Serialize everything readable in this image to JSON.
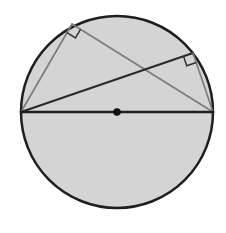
{
  "diagram": {
    "colors": {
      "background": "#ffffff",
      "circle_fill": "#d4d4d4",
      "circle_stroke": "#1e1e1e",
      "diameter_stroke": "#1e1e1e",
      "chord_dark": "#2a2a2a",
      "chord_light": "#7a7a7a",
      "right_angle_marker": "#333333",
      "center_dot": "#111111"
    },
    "circle": {
      "cx": 117,
      "cy": 112,
      "r": 96
    },
    "points": {
      "A": {
        "x": 21,
        "y": 112
      },
      "B": {
        "x": 213,
        "y": 112
      },
      "C": {
        "x": 72,
        "y": 24
      },
      "D": {
        "x": 193,
        "y": 53
      },
      "O": {
        "x": 117,
        "y": 112
      }
    },
    "segments": [
      {
        "name": "diameter",
        "from": "A",
        "to": "B"
      },
      {
        "name": "chord-AC",
        "from": "A",
        "to": "C"
      },
      {
        "name": "chord-CB",
        "from": "C",
        "to": "B"
      },
      {
        "name": "chord-AD",
        "from": "A",
        "to": "D"
      },
      {
        "name": "chord-DB",
        "from": "D",
        "to": "B"
      }
    ],
    "right_angles": [
      {
        "at": "C",
        "label": "right angle at C"
      },
      {
        "at": "D",
        "label": "right angle at D"
      }
    ]
  }
}
